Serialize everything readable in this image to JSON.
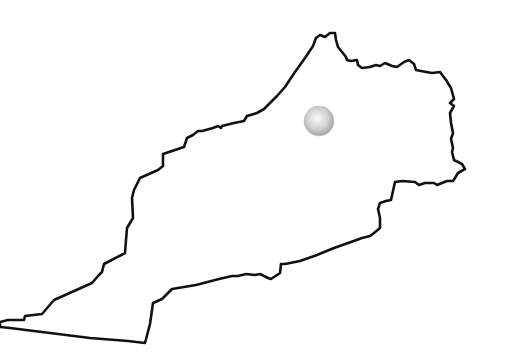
{
  "map": {
    "title": "Country outline map",
    "region_shape": "country-outline",
    "outline_color": "#111111",
    "fill_color": "#ffffff",
    "background": "#ffffff",
    "marker": {
      "type": "sphere-marker",
      "cx": 319,
      "cy": 121,
      "r": 15,
      "color_light": "#f4f4f4",
      "color_dark": "#a8a8a8"
    }
  }
}
